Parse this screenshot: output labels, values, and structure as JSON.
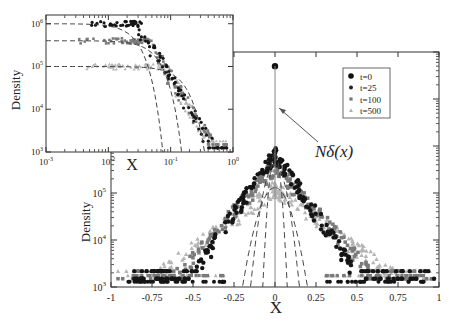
{
  "chart_data": [
    {
      "id": "main",
      "type": "scatter",
      "title": "",
      "xlabel": "X",
      "ylabel": "Density",
      "xlim": [
        -1,
        1
      ],
      "ylim": [
        1000,
        100000000
      ],
      "yscale": "log",
      "xticks": [
        -1,
        -0.75,
        -0.5,
        -0.25,
        0,
        0.25,
        0.5,
        0.75,
        1
      ],
      "xtick_labels": [
        "-1",
        "-0.75",
        "-0.5",
        "-0.25",
        "0",
        "0.25",
        "0.5",
        "0.75",
        "1"
      ],
      "ytick_labels": [
        {
          "value": 1000,
          "base": "10",
          "exp": "3"
        },
        {
          "value": 10000,
          "base": "10",
          "exp": "4"
        },
        {
          "value": 100000,
          "base": "10",
          "exp": "5"
        }
      ],
      "grid": false,
      "legend": {
        "position": "upper right",
        "entries": [
          {
            "label": "t=0",
            "marker": "circle-large",
            "color": "#111111"
          },
          {
            "label": "t=25",
            "marker": "circle",
            "color": "#222222"
          },
          {
            "label": "t=100",
            "marker": "square",
            "color": "#777777"
          },
          {
            "label": "t=500",
            "marker": "triangle",
            "color": "#b0b0b0"
          }
        ]
      },
      "annotation": {
        "text": "Nδ(x)",
        "arrow_to": [
          0,
          3000000
        ]
      },
      "delta_peak": {
        "x": 0,
        "y": 50000000
      },
      "series": [
        {
          "name": "t=0",
          "x": [
            0
          ],
          "y": [
            50000000
          ]
        },
        {
          "name": "t=25",
          "peak": 700000,
          "width": 0.085,
          "tail_floor": 1500
        },
        {
          "name": "t=100",
          "peak": 400000,
          "width": 0.11,
          "tail_floor": 1500
        },
        {
          "name": "t=500",
          "peak": 130000,
          "width": 0.17,
          "tail_floor": 1500
        }
      ],
      "dashed_curves": [
        {
          "peak": 700000,
          "cutoff": 0.075
        },
        {
          "peak": 400000,
          "cutoff": 0.15
        },
        {
          "peak": 130000,
          "cutoff": 0.2
        }
      ]
    },
    {
      "id": "inset",
      "type": "scatter",
      "title": "",
      "xlabel": "X",
      "ylabel": "Density",
      "xscale": "log",
      "yscale": "log",
      "xlim": [
        0.001,
        1
      ],
      "ylim": [
        1000,
        1500000
      ],
      "xtick_labels": [
        {
          "value": 0.001,
          "base": "10",
          "exp": "-3"
        },
        {
          "value": 0.01,
          "base": "10",
          "exp": "-2"
        },
        {
          "value": 0.1,
          "base": "10",
          "exp": "-1"
        },
        {
          "value": 1,
          "base": "10",
          "exp": "0"
        }
      ],
      "ytick_labels": [
        {
          "value": 1000,
          "base": "10",
          "exp": "3"
        },
        {
          "value": 10000,
          "base": "10",
          "exp": "4"
        },
        {
          "value": 100000,
          "base": "10",
          "exp": "5"
        },
        {
          "value": 1000000,
          "base": "10",
          "exp": "6"
        }
      ],
      "grid": false,
      "dashed_curves": [
        {
          "plateau": 1000000,
          "cutoff": 0.075
        },
        {
          "plateau": 400000,
          "cutoff": 0.15
        },
        {
          "plateau": 100000,
          "cutoff": 0.35
        }
      ],
      "series": [
        {
          "name": "t=25",
          "plateau": 1000000,
          "knee": 0.03
        },
        {
          "name": "t=100",
          "plateau": 400000,
          "knee": 0.045
        },
        {
          "name": "t=500",
          "plateau": 100000,
          "knee": 0.08
        }
      ]
    }
  ],
  "labels": {
    "main_xlabel": "X",
    "main_ylabel": "Density",
    "inset_xlabel": "X",
    "inset_ylabel": "Density",
    "annotation": "Nδ(x)"
  }
}
